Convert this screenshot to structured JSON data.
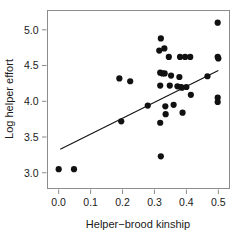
{
  "chart_data": {
    "type": "scatter",
    "title": "",
    "xlabel": "Helper−brood kinship",
    "ylabel": "Log helper effort",
    "xlim": [
      -0.035,
      0.535
    ],
    "ylim": [
      2.78,
      5.27
    ],
    "xticks": [
      0.0,
      0.1,
      0.2,
      0.3,
      0.4,
      0.5
    ],
    "xticklabels": [
      "0.0",
      "0.1",
      "0.2",
      "0.3",
      "0.4",
      "0.5"
    ],
    "yticks": [
      3.0,
      3.5,
      4.0,
      4.5,
      5.0
    ],
    "yticklabels": [
      "3.0",
      "3.5",
      "4.0",
      "4.5",
      "5.0"
    ],
    "grid": false,
    "legend": null,
    "marker": "filled-circle",
    "marker_color": "#111111",
    "marker_radius_px": 3.1,
    "frame_color": "#8c8c8c",
    "points": [
      {
        "x": 0.0,
        "y": 3.05
      },
      {
        "x": 0.048,
        "y": 3.05
      },
      {
        "x": 0.19,
        "y": 4.32
      },
      {
        "x": 0.196,
        "y": 3.72
      },
      {
        "x": 0.224,
        "y": 4.28
      },
      {
        "x": 0.279,
        "y": 3.94
      },
      {
        "x": 0.315,
        "y": 4.71
      },
      {
        "x": 0.318,
        "y": 4.4
      },
      {
        "x": 0.318,
        "y": 4.22
      },
      {
        "x": 0.318,
        "y": 3.7
      },
      {
        "x": 0.32,
        "y": 4.88
      },
      {
        "x": 0.32,
        "y": 3.23
      },
      {
        "x": 0.325,
        "y": 4.39
      },
      {
        "x": 0.331,
        "y": 4.74
      },
      {
        "x": 0.332,
        "y": 4.39
      },
      {
        "x": 0.334,
        "y": 3.93
      },
      {
        "x": 0.335,
        "y": 3.82
      },
      {
        "x": 0.345,
        "y": 4.62
      },
      {
        "x": 0.348,
        "y": 4.22
      },
      {
        "x": 0.352,
        "y": 4.36
      },
      {
        "x": 0.36,
        "y": 3.95
      },
      {
        "x": 0.372,
        "y": 4.21
      },
      {
        "x": 0.378,
        "y": 4.34
      },
      {
        "x": 0.38,
        "y": 4.62
      },
      {
        "x": 0.383,
        "y": 4.2
      },
      {
        "x": 0.386,
        "y": 4.19
      },
      {
        "x": 0.388,
        "y": 3.84
      },
      {
        "x": 0.396,
        "y": 4.62
      },
      {
        "x": 0.4,
        "y": 4.2
      },
      {
        "x": 0.412,
        "y": 4.62
      },
      {
        "x": 0.414,
        "y": 4.09
      },
      {
        "x": 0.466,
        "y": 4.35
      },
      {
        "x": 0.498,
        "y": 5.1
      },
      {
        "x": 0.498,
        "y": 4.62
      },
      {
        "x": 0.5,
        "y": 4.6
      },
      {
        "x": 0.498,
        "y": 4.05
      },
      {
        "x": 0.498,
        "y": 3.99
      }
    ],
    "regression_line": {
      "x": [
        0.005,
        0.5
      ],
      "y": [
        3.33,
        4.43
      ],
      "color": "#111111"
    }
  }
}
